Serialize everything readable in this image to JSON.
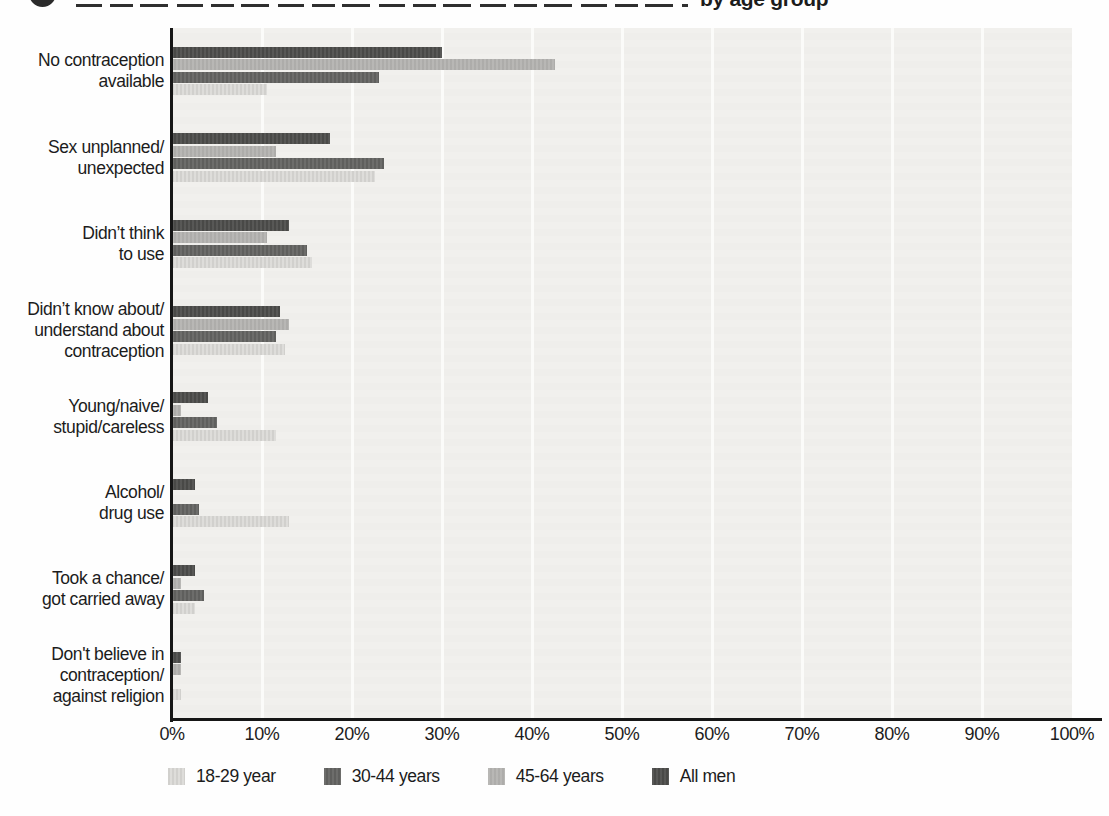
{
  "header": {
    "logo": "dark-dot-logo",
    "title_visible_fragment": "by age group"
  },
  "chart_data": {
    "type": "bar",
    "orientation": "horizontal",
    "title_partial": "by age group",
    "x_ticks": [
      "0%",
      "10%",
      "20%",
      "30%",
      "40%",
      "50%",
      "60%",
      "70%",
      "80%",
      "90%",
      "100%"
    ],
    "xlim": [
      0,
      100
    ],
    "grid": "vertical-gridlines-every-10pct",
    "legend_position": "bottom",
    "bar_row_order_top_to_bottom": [
      "All men",
      "45-64 years",
      "30-44 years",
      "18-29 year"
    ],
    "categories": [
      {
        "label": "No contraception available",
        "lines": [
          "No contraception",
          "available"
        ]
      },
      {
        "label": "Sex unplanned/unexpected",
        "lines": [
          "Sex unplanned/",
          "unexpected"
        ]
      },
      {
        "label": "Didn’t think to use",
        "lines": [
          "Didn’t think",
          "to use"
        ]
      },
      {
        "label": "Didn’t know about/understand about contraception",
        "lines": [
          "Didn’t know about/",
          "understand about",
          "contraception"
        ]
      },
      {
        "label": "Young/naive/stupid/careless",
        "lines": [
          "Young/naive/",
          "stupid/careless"
        ]
      },
      {
        "label": "Alcohol/drug use",
        "lines": [
          "Alcohol/",
          "drug use"
        ]
      },
      {
        "label": "Took a chance/got carried away",
        "lines": [
          "Took a chance/",
          "got carried away"
        ]
      },
      {
        "label": "Don't believe in contraception/against religion",
        "lines": [
          "Don't believe in",
          "contraception/",
          "against religion"
        ]
      }
    ],
    "series": [
      {
        "name": "18-29 year",
        "color": "#dcdbd8",
        "pattern": "vertical-stripes",
        "values": [
          10.5,
          22.5,
          15.5,
          12.5,
          11.5,
          13,
          2.5,
          1
        ]
      },
      {
        "name": "30-44 years",
        "color": "#626260",
        "values": [
          23,
          23.5,
          15,
          11.5,
          5,
          3,
          3.5,
          0
        ]
      },
      {
        "name": "45-64 years",
        "color": "#b3b2af",
        "values": [
          42.5,
          11.5,
          10.5,
          13,
          1,
          0,
          1,
          1
        ]
      },
      {
        "name": "All men",
        "color": "#4b4b49",
        "values": [
          30,
          17.5,
          13,
          12,
          4,
          2.5,
          2.5,
          1
        ]
      }
    ]
  }
}
